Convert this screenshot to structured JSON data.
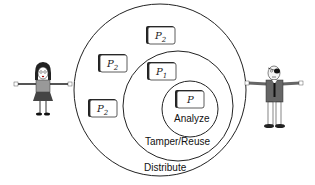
{
  "diagram": {
    "rings": {
      "outer": {
        "label": "Distribute"
      },
      "middle": {
        "label": "Tamper/Reuse"
      },
      "inner": {
        "label": "Analyze"
      }
    },
    "programs": [
      {
        "id": "p2-top",
        "name": "P",
        "subscript": "2",
        "ring": "outer"
      },
      {
        "id": "p2-left-upper",
        "name": "P",
        "subscript": "2",
        "ring": "outer"
      },
      {
        "id": "p2-left-lower",
        "name": "P",
        "subscript": "2",
        "ring": "outer"
      },
      {
        "id": "p1",
        "name": "P",
        "subscript": "1",
        "ring": "middle"
      },
      {
        "id": "p",
        "name": "P",
        "subscript": "",
        "ring": "inner"
      }
    ],
    "actors": [
      {
        "id": "girl",
        "role": "defender",
        "side": "left"
      },
      {
        "id": "pirate",
        "role": "attacker",
        "side": "right"
      }
    ]
  }
}
